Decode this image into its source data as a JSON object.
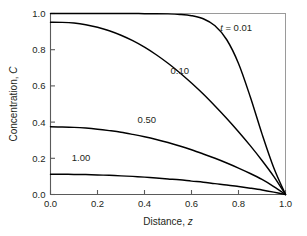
{
  "chart_data": {
    "type": "line",
    "title": "",
    "xlabel": "Distance, z",
    "xlabel_main": "Distance, ",
    "xlabel_italic": "z",
    "ylabel": "Concentration, C",
    "ylabel_main": "Concentration, ",
    "ylabel_italic": "C",
    "xlim": [
      0.0,
      1.0
    ],
    "ylim": [
      0.0,
      1.0
    ],
    "grid": false,
    "legend": "inline-curve-labels",
    "xticks": [
      "0.0",
      "0.2",
      "0.4",
      "0.6",
      "0.8",
      "1.0"
    ],
    "xtick_values": [
      0.0,
      0.2,
      0.4,
      0.6,
      0.8,
      1.0
    ],
    "yticks": [
      "0.0",
      "0.2",
      "0.4",
      "0.6",
      "0.8",
      "1.0"
    ],
    "ytick_values": [
      0.0,
      0.2,
      0.4,
      0.6,
      0.8,
      1.0
    ],
    "x": [
      0.0,
      0.05,
      0.1,
      0.15,
      0.2,
      0.25,
      0.3,
      0.35,
      0.4,
      0.45,
      0.5,
      0.55,
      0.6,
      0.65,
      0.7,
      0.75,
      0.8,
      0.85,
      0.9,
      0.95,
      1.0
    ],
    "series": [
      {
        "name": "t = 0.01",
        "label": "t = 0.01",
        "label_italic": "t",
        "label_rest": " = 0.01",
        "label_x": 0.79,
        "label_y": 0.905,
        "color": "#000000",
        "values": [
          1.0,
          1.0,
          1.0,
          1.0,
          1.0,
          1.0,
          1.0,
          1.0,
          0.999,
          0.999,
          0.998,
          0.995,
          0.988,
          0.971,
          0.932,
          0.855,
          0.724,
          0.54,
          0.335,
          0.148,
          0.0
        ]
      },
      {
        "name": "0.10",
        "label": "0.10",
        "label_x": 0.55,
        "label_y": 0.665,
        "color": "#000000",
        "values": [
          0.952,
          0.951,
          0.947,
          0.938,
          0.924,
          0.905,
          0.88,
          0.85,
          0.814,
          0.772,
          0.725,
          0.673,
          0.616,
          0.555,
          0.489,
          0.42,
          0.347,
          0.27,
          0.188,
          0.1,
          0.0
        ]
      },
      {
        "name": "0.50",
        "label": "0.50",
        "label_x": 0.41,
        "label_y": 0.395,
        "color": "#000000",
        "values": [
          0.374,
          0.373,
          0.371,
          0.367,
          0.361,
          0.353,
          0.344,
          0.332,
          0.319,
          0.304,
          0.287,
          0.268,
          0.247,
          0.224,
          0.2,
          0.174,
          0.146,
          0.116,
          0.083,
          0.044,
          0.0
        ]
      },
      {
        "name": "1.00",
        "label": "1.00",
        "label_x": 0.13,
        "label_y": 0.185,
        "color": "#000000",
        "values": [
          0.112,
          0.112,
          0.111,
          0.11,
          0.108,
          0.106,
          0.103,
          0.1,
          0.096,
          0.091,
          0.086,
          0.081,
          0.074,
          0.068,
          0.06,
          0.053,
          0.044,
          0.035,
          0.025,
          0.013,
          0.0
        ]
      }
    ]
  },
  "figure": {
    "background": "#ffffff",
    "frame_color": "#9a9a9a",
    "axis_color": "#5a5a5a",
    "curve_color": "#000000"
  }
}
